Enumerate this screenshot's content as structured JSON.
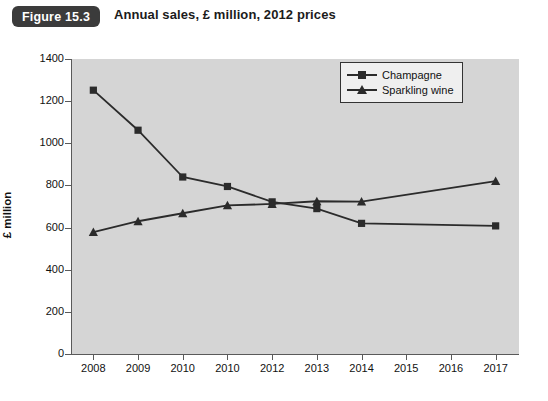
{
  "header": {
    "figure_badge": "Figure 15.3",
    "title": "Annual sales, £ million, 2012 prices"
  },
  "chart_data": {
    "type": "line",
    "title": "Annual sales, £ million, 2012 prices",
    "xlabel": "",
    "ylabel": "£ million",
    "categories": [
      "2008",
      "2009",
      "2010",
      "2010",
      "2012",
      "2013",
      "2014",
      "2015",
      "2016",
      "2017"
    ],
    "ylim": [
      0,
      1400
    ],
    "ytick_values": [
      0,
      200,
      400,
      600,
      800,
      1000,
      1200,
      1400
    ],
    "ytick_labels": [
      "0",
      "200",
      "400",
      "600",
      "800",
      "1000",
      "1200",
      "1400"
    ],
    "grid": false,
    "legend_position": "top-right",
    "series": [
      {
        "name": "Champagne",
        "marker": "square",
        "color": "#2b2b2b",
        "values": [
          1252,
          1062,
          840,
          795,
          722,
          690,
          620,
          null,
          null,
          608
        ]
      },
      {
        "name": "Sparkling wine",
        "marker": "triangle",
        "color": "#2b2b2b",
        "values": [
          578,
          630,
          668,
          705,
          712,
          725,
          723,
          null,
          null,
          820
        ]
      }
    ]
  },
  "colors": {
    "plot_background": "#d5d5d5",
    "axis": "#5a5a5a",
    "series": "#2b2b2b",
    "badge_background": "#3b3b3b",
    "page_background": "#ffffff"
  }
}
